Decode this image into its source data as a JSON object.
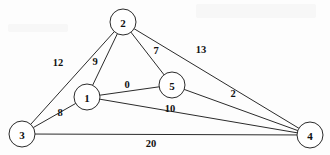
{
  "figure": {
    "background_color": "#fdfdfd",
    "stroke_color": "#2b2b2b",
    "text_color": "#111111",
    "width": 330,
    "height": 155
  },
  "chart_data": {
    "type": "diagram",
    "diagram_type": "weighted-undirected-graph",
    "title": "",
    "nodes": [
      {
        "id": "1",
        "label": "1",
        "x": 87,
        "y": 97,
        "r": 13
      },
      {
        "id": "2",
        "label": "2",
        "x": 123,
        "y": 22,
        "r": 13
      },
      {
        "id": "3",
        "label": "3",
        "x": 22,
        "y": 134,
        "r": 13
      },
      {
        "id": "4",
        "label": "4",
        "x": 310,
        "y": 135,
        "r": 13
      },
      {
        "id": "5",
        "label": "5",
        "x": 172,
        "y": 85,
        "r": 13
      }
    ],
    "edges": [
      {
        "source": "3",
        "target": "2",
        "weight": 12,
        "label": "12",
        "label_x": 58,
        "label_y": 62
      },
      {
        "source": "1",
        "target": "2",
        "weight": 9,
        "label": "9",
        "label_x": 95,
        "label_y": 61
      },
      {
        "source": "2",
        "target": "5",
        "weight": 7,
        "label": "7",
        "label_x": 156,
        "label_y": 50
      },
      {
        "source": "2",
        "target": "4",
        "weight": 13,
        "label": "13",
        "label_x": 201,
        "label_y": 49
      },
      {
        "source": "1",
        "target": "5",
        "weight": 0,
        "label": "0",
        "label_x": 127,
        "label_y": 84
      },
      {
        "source": "5",
        "target": "4",
        "weight": 2,
        "label": "2",
        "label_x": 233,
        "label_y": 93
      },
      {
        "source": "3",
        "target": "1",
        "weight": 8,
        "label": "8",
        "label_x": 60,
        "label_y": 112
      },
      {
        "source": "1",
        "target": "4",
        "weight": 10,
        "label": "10",
        "label_x": 170,
        "label_y": 108
      },
      {
        "source": "3",
        "target": "4",
        "weight": 20,
        "label": "20",
        "label_x": 151,
        "label_y": 143
      }
    ],
    "node_count": 5,
    "edge_count": 9,
    "weights": [
      12,
      9,
      7,
      13,
      0,
      2,
      8,
      10,
      20
    ]
  }
}
